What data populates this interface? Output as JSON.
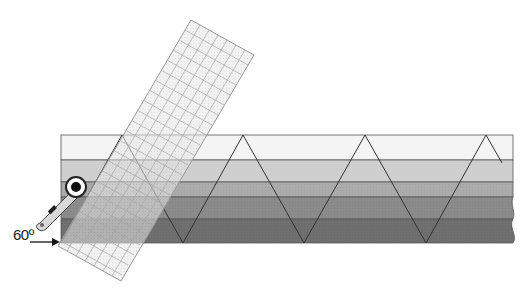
{
  "diagram": {
    "angle_label": "60º",
    "strip": {
      "left": 61,
      "right": 513,
      "top": 135,
      "bottom": 243,
      "bands": [
        {
          "name": "band-1",
          "y": 135,
          "h": 25,
          "color": "#f4f4f4"
        },
        {
          "name": "band-2",
          "y": 160,
          "h": 22,
          "color": "#cfcfcf"
        },
        {
          "name": "band-3",
          "y": 182,
          "h": 15,
          "color": "#ababab"
        },
        {
          "name": "band-4",
          "y": 197,
          "h": 22,
          "color": "#8b8b8b"
        },
        {
          "name": "band-5",
          "y": 219,
          "h": 24,
          "color": "#6f6f6f"
        }
      ]
    },
    "zigzag_points": [
      [
        61,
        243
      ],
      [
        122,
        135
      ],
      [
        183,
        243
      ],
      [
        243,
        135
      ],
      [
        304,
        243
      ],
      [
        365,
        135
      ],
      [
        426,
        243
      ],
      [
        486,
        135
      ],
      [
        502,
        163
      ]
    ],
    "ruler": {
      "corners": [
        [
          191,
          20
        ],
        [
          254,
          55
        ],
        [
          121,
          281
        ],
        [
          58,
          246
        ]
      ],
      "color": "#e6e6e6",
      "grid_color": "#999999"
    },
    "tool": "rotary-cutter",
    "colors": {
      "line": "#333333",
      "arrow": "#111111"
    }
  }
}
